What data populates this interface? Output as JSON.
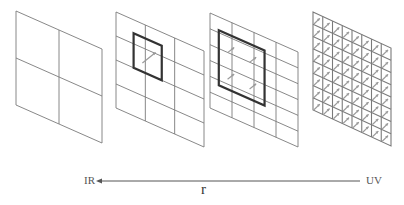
{
  "figure": {
    "panels": [
      {
        "id": 1,
        "grid_cols": 2,
        "grid_rows": 2,
        "highlight": null,
        "arrows": 0
      },
      {
        "id": 2,
        "grid_cols": 3,
        "grid_rows": 4,
        "highlight": "small thick square with one arrow",
        "arrows": 1
      },
      {
        "id": 3,
        "grid_cols": 4,
        "grid_rows": 6,
        "highlight": "thick rectangle with four arrows",
        "arrows": 4
      },
      {
        "id": 4,
        "grid_cols": 8,
        "grid_rows": 8,
        "highlight": null,
        "arrows": 64
      }
    ],
    "axis": {
      "left_label": "IR",
      "right_label": "UV",
      "center_label": "r",
      "direction": "right-to-left"
    },
    "colors": {
      "grid_line": "#7a7a7a",
      "highlight": "#333333",
      "arrow": "#9a9a9a"
    }
  }
}
